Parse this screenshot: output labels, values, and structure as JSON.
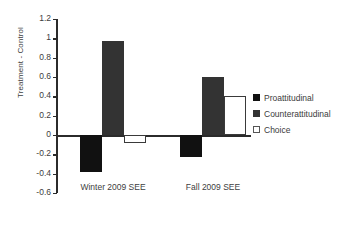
{
  "chart_data": {
    "type": "bar",
    "title": "",
    "xlabel": "",
    "ylabel": "Treatment - Control",
    "categories": [
      "Winter 2009 SEE",
      "Fall 2009 SEE"
    ],
    "series": [
      {
        "name": "Proattitudinal",
        "color": "#111111",
        "values": [
          -0.38,
          -0.23
        ]
      },
      {
        "name": "Counterattitudinal",
        "color": "#333333",
        "values": [
          0.97,
          0.6
        ]
      },
      {
        "name": "Choice",
        "color": "#ffffff",
        "values": [
          -0.08,
          0.4
        ]
      }
    ],
    "ylim": [
      -0.6,
      1.2
    ],
    "ytick_step": 0.2,
    "yticks": [
      "1.2",
      "1",
      "0.8",
      "0.6",
      "0.4",
      "0.2",
      "0",
      "-0.2",
      "-0.4",
      "-0.6"
    ],
    "ytick_values": [
      1.2,
      1,
      0.8,
      0.6,
      0.4,
      0.2,
      0,
      -0.2,
      -0.4,
      -0.6
    ],
    "grid": false,
    "legend_position": "right"
  },
  "legend": {
    "items": [
      {
        "label": "Proattitudinal"
      },
      {
        "label": "Counterattitudinal"
      },
      {
        "label": "Choice"
      }
    ]
  }
}
